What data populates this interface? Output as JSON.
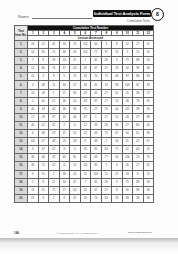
{
  "header": {
    "name_label": "Name",
    "form_title": "Individual Test Analysis Form",
    "badge": "8",
    "subtitle": "Cumulative Tests"
  },
  "table": {
    "corner_label": "Test Item No.",
    "group_header": "Cumulative Test Number",
    "test_numbers": [
      "1",
      "2",
      "3",
      "4",
      "5",
      "6",
      "7",
      "8",
      "9",
      "10",
      "11",
      "12"
    ],
    "lesson_header": "Lesson Assessed",
    "rows": [
      {
        "no": "1.",
        "cells": [
          "20",
          "12",
          "45",
          "16",
          "15",
          "112",
          "50",
          "3",
          "8",
          "52",
          "27",
          "51"
        ]
      },
      {
        "no": "2.",
        "cells": [
          "10",
          "35",
          "15",
          "48",
          "40",
          "102",
          "77",
          "87",
          "10",
          "2",
          "15",
          "10"
        ]
      },
      {
        "no": "3.",
        "cells": [
          "7",
          "8",
          "33",
          "23",
          "47",
          "7",
          "35",
          "28",
          "9",
          "75",
          "88",
          "59"
        ]
      },
      {
        "no": "4.",
        "cells": [
          "12",
          "66",
          "76",
          "37",
          "112",
          "26",
          "47",
          "27",
          "18",
          "56",
          "98",
          "36"
        ]
      },
      {
        "no": "5.",
        "cells": [
          "41",
          "5",
          "8",
          "5",
          "15",
          "34",
          "70",
          "72",
          "36",
          "97",
          "86",
          "83"
        ]
      },
      {
        "no": "6.",
        "cells": [
          "4",
          "48",
          "11",
          "40",
          "57",
          "34",
          "45",
          "13",
          "83",
          "109",
          "92",
          "33"
        ]
      },
      {
        "no": "7.",
        "cells": [
          "16",
          "18",
          "5",
          "57",
          "90",
          "20",
          "41",
          "27",
          "62",
          "55",
          "36",
          "27"
        ]
      },
      {
        "no": "8.",
        "cells": [
          "2",
          "40",
          "21",
          "36",
          "25",
          "43",
          "87",
          "17",
          "72",
          "38",
          "78",
          "92"
        ]
      },
      {
        "no": "9.",
        "cells": [
          "40",
          "43",
          "44",
          "36",
          "96",
          "75",
          "27",
          "76",
          "44",
          "105",
          "39",
          "30"
        ]
      },
      {
        "no": "10.",
        "cells": [
          "17",
          "29",
          "37",
          "33",
          "46",
          "47",
          "1",
          "57",
          "51",
          "28",
          "37",
          "88"
        ]
      },
      {
        "no": "11.",
        "cells": [
          "40",
          "22",
          "41",
          "2",
          "6",
          "12",
          "34",
          "26",
          "92",
          "27",
          "80",
          "40"
        ]
      },
      {
        "no": "12.",
        "cells": [
          "6",
          "36",
          "29",
          "37",
          "52",
          "22",
          "49",
          "75",
          "67",
          "94",
          "61",
          "96"
        ]
      },
      {
        "no": "13.",
        "cells": [
          "110",
          "27",
          "48",
          "29",
          "28",
          "8",
          "68",
          "2",
          "43",
          "31",
          "41",
          "67"
        ]
      },
      {
        "no": "14.",
        "cells": [
          "3",
          "47",
          "52",
          "8",
          "5",
          "35",
          "81",
          "63",
          "71",
          "42",
          "64",
          "55"
        ]
      },
      {
        "no": "15.",
        "cells": [
          "30",
          "46",
          "33",
          "63",
          "81",
          "65",
          "63",
          "77",
          "34",
          "106",
          "53",
          "75"
        ]
      },
      {
        "no": "16.",
        "cells": [
          "30",
          "11",
          "20",
          "11",
          "15",
          "110",
          "30",
          "5",
          "3",
          "26",
          "27",
          "31"
        ]
      },
      {
        "no": "17.",
        "cells": [
          "9",
          "15",
          "5",
          "39",
          "42",
          "24",
          "103",
          "21",
          "57",
          "18",
          "3",
          "15"
        ]
      },
      {
        "no": "18.",
        "cells": [
          "1",
          "8",
          "21",
          "34",
          "47",
          "7",
          "35",
          "28",
          "9",
          "75",
          "88",
          "39"
        ]
      },
      {
        "no": "19.",
        "cells": [
          "11",
          "25",
          "75",
          "27",
          "112",
          "26",
          "47",
          "27",
          "8",
          "56",
          "98",
          "36"
        ]
      },
      {
        "no": "20.",
        "cells": [
          "21",
          "3",
          "5",
          "8",
          "37",
          "19",
          "74",
          "63",
          "26",
          "38",
          "36",
          "36"
        ]
      }
    ]
  },
  "footer": {
    "page_number": "146",
    "copyright": "© Pearson Education, Inc. All Rights Reserved.",
    "right_text": "Saxon Math Course 1"
  }
}
